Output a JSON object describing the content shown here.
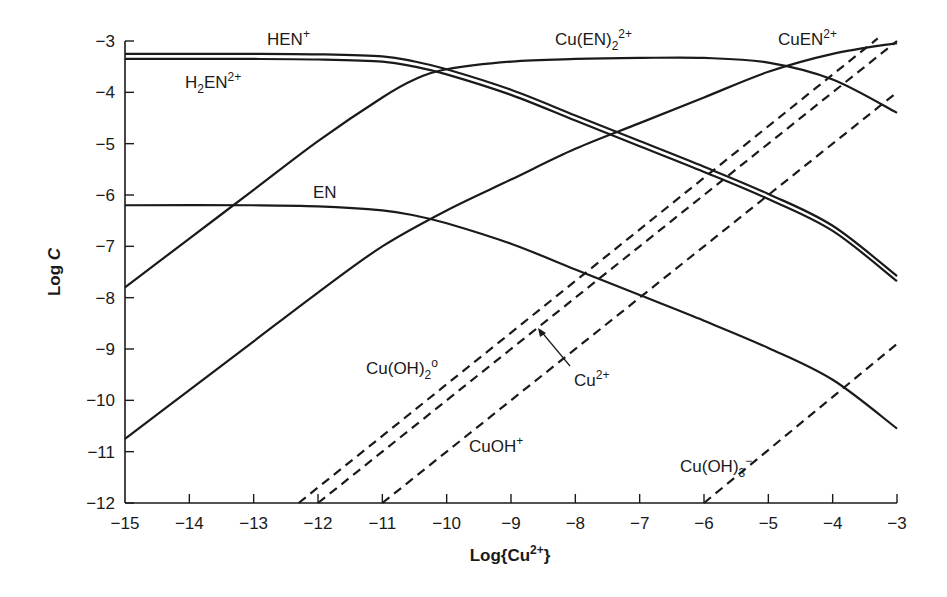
{
  "chart_data": {
    "type": "line",
    "title": "",
    "xlabel": "Log{Cu2+}",
    "ylabel": "Log C",
    "xlim": [
      -15,
      -3
    ],
    "ylim": [
      -12,
      -3
    ],
    "grid": false,
    "legend": "inline labels",
    "x_ticks": [
      -15,
      -14,
      -13,
      -12,
      -11,
      -10,
      -9,
      -8,
      -7,
      -6,
      -5,
      -4,
      -3
    ],
    "x_tick_labels": [
      "−15",
      "−14",
      "−13",
      "−12",
      "−11",
      "−10",
      "−9",
      "−8",
      "−7",
      "−6",
      "−5",
      "−4",
      "−3"
    ],
    "y_ticks": [
      -3,
      -4,
      -5,
      -6,
      -7,
      -8,
      -9,
      -10,
      -11,
      -12
    ],
    "y_tick_labels": [
      "−3",
      "−4",
      "−5",
      "−6",
      "−7",
      "−8",
      "−9",
      "−10",
      "−11",
      "−12"
    ],
    "series": [
      {
        "name": "HEN+",
        "style": "solid",
        "x": [
          -15,
          -13,
          -12,
          -11,
          -10.5,
          -10,
          -9,
          -8,
          -7,
          -6,
          -5,
          -4,
          -3
        ],
        "y": [
          -3.25,
          -3.25,
          -3.26,
          -3.3,
          -3.4,
          -3.55,
          -3.95,
          -4.45,
          -4.95,
          -5.45,
          -5.98,
          -6.6,
          -7.58
        ]
      },
      {
        "name": "H2EN2+",
        "style": "solid",
        "x": [
          -15,
          -13,
          -12,
          -11,
          -10.5,
          -10,
          -9,
          -8,
          -7,
          -6,
          -5,
          -4,
          -3
        ],
        "y": [
          -3.35,
          -3.35,
          -3.36,
          -3.4,
          -3.5,
          -3.65,
          -4.05,
          -4.55,
          -5.05,
          -5.55,
          -6.08,
          -6.7,
          -7.68
        ]
      },
      {
        "name": "EN",
        "style": "solid",
        "x": [
          -15,
          -13,
          -12,
          -11,
          -10.5,
          -10,
          -9,
          -8,
          -7,
          -6,
          -5,
          -4,
          -3
        ],
        "y": [
          -6.2,
          -6.2,
          -6.22,
          -6.3,
          -6.4,
          -6.55,
          -6.95,
          -7.45,
          -7.95,
          -8.45,
          -8.98,
          -9.6,
          -10.55
        ]
      },
      {
        "name": "Cu(EN)2 2+",
        "style": "solid",
        "x": [
          -15,
          -14,
          -13,
          -12,
          -11,
          -10.5,
          -10,
          -9,
          -8,
          -7,
          -6,
          -5,
          -4,
          -3
        ],
        "y": [
          -7.8,
          -6.85,
          -5.9,
          -4.95,
          -4.1,
          -3.75,
          -3.55,
          -3.4,
          -3.35,
          -3.33,
          -3.33,
          -3.42,
          -3.75,
          -4.4
        ]
      },
      {
        "name": "CuEN2+",
        "style": "solid",
        "x": [
          -15,
          -14,
          -13,
          -12,
          -11,
          -10,
          -9,
          -8,
          -7,
          -6,
          -5,
          -4,
          -3
        ],
        "y": [
          -10.75,
          -9.8,
          -8.85,
          -7.9,
          -7.0,
          -6.3,
          -5.7,
          -5.1,
          -4.6,
          -4.1,
          -3.6,
          -3.25,
          -3.04
        ]
      },
      {
        "name": "Cu(OH)2 0",
        "style": "dashed",
        "x": [
          -12.3,
          -3.3
        ],
        "y": [
          -12,
          -2.95
        ]
      },
      {
        "name": "Cu2+",
        "style": "dashed",
        "x": [
          -12,
          -3
        ],
        "y": [
          -12,
          -3
        ]
      },
      {
        "name": "CuOH+",
        "style": "dashed",
        "x": [
          -11,
          -3
        ],
        "y": [
          -12,
          -4
        ]
      },
      {
        "name": "Cu(OH)3-",
        "style": "dashed",
        "x": [
          -6,
          -3
        ],
        "y": [
          -12,
          -8.9
        ]
      }
    ],
    "annotations": [
      {
        "text": "HEN+",
        "x": -12.8,
        "y": -3.0
      },
      {
        "text": "H2EN2+",
        "x": -14.0,
        "y": -3.85
      },
      {
        "text": "EN",
        "x": -12.2,
        "y": -6.0
      },
      {
        "text": "Cu(EN)2 2+",
        "x": -8.4,
        "y": -3.0
      },
      {
        "text": "CuEN2+",
        "x": -4.8,
        "y": -3.0
      },
      {
        "text": "Cu(OH)2 0",
        "x": -10.4,
        "y": -9.5
      },
      {
        "text": "Cu2+",
        "x": -7.5,
        "y": -9.7,
        "arrow_to": [
          -8.0,
          -9.0
        ]
      },
      {
        "text": "CuOH+",
        "x": -8.7,
        "y": -11.0
      },
      {
        "text": "Cu(OH)3-",
        "x": -4.8,
        "y": -11.4
      }
    ]
  },
  "axes": {
    "xlabel_main": "Log{Cu",
    "xlabel_sup": "2+",
    "xlabel_end": "}",
    "ylabel_main": "Log ",
    "ylabel_italic": "C"
  },
  "labels": {
    "hen": {
      "main": "HEN",
      "sup": "+"
    },
    "h2en": {
      "main": "H",
      "sub": "2",
      "main2": "EN",
      "sup": "2+"
    },
    "en": {
      "main": "EN"
    },
    "cuen2": {
      "main": "Cu(EN)",
      "sub": "2",
      "sup": "2+"
    },
    "cuen": {
      "main": "CuEN",
      "sup": "2+"
    },
    "cuoh2": {
      "main": "Cu(OH)",
      "sub": "2",
      "sup": "o"
    },
    "cu": {
      "main": "Cu",
      "sup": "2+"
    },
    "cuoh": {
      "main": "CuOH",
      "sup": "+"
    },
    "cuoh3": {
      "main": "Cu(OH)",
      "sub": "3",
      "sup": "−"
    }
  }
}
